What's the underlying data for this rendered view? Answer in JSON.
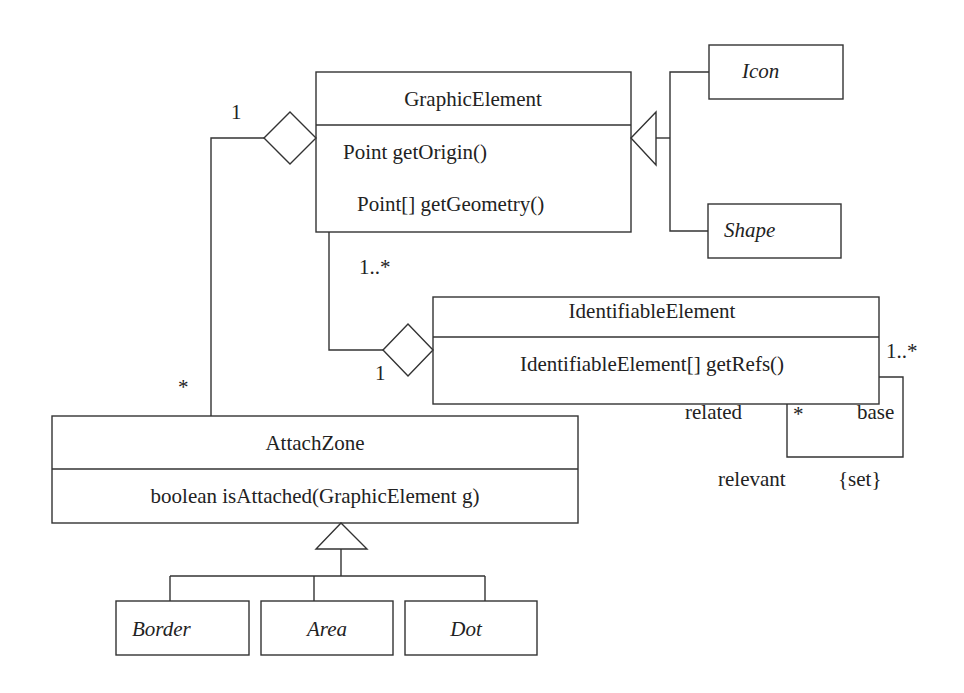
{
  "diagram": {
    "type": "UML class diagram",
    "classes": {
      "graphic_element": {
        "name": "GraphicElement",
        "methods": [
          "Point getOrigin()",
          "Point[] getGeometry()"
        ]
      },
      "icon": {
        "name": "Icon",
        "abstract_italic": true
      },
      "shape": {
        "name": "Shape",
        "abstract_italic": true
      },
      "identifiable_element": {
        "name": "IdentifiableElement",
        "methods": [
          "IdentifiableElement[] getRefs()"
        ]
      },
      "attach_zone": {
        "name": "AttachZone",
        "methods": [
          "boolean isAttached(GraphicElement g)"
        ]
      },
      "border": {
        "name": "Border",
        "abstract_italic": true
      },
      "area": {
        "name": "Area",
        "abstract_italic": true
      },
      "dot": {
        "name": "Dot",
        "abstract_italic": true
      }
    },
    "relationships": {
      "attach_aggregation": {
        "kind": "aggregation",
        "whole": "GraphicElement",
        "part": "AttachZone",
        "whole_multiplicity": "1",
        "part_multiplicity": "*"
      },
      "identifiable_aggregation": {
        "kind": "aggregation",
        "whole": "IdentifiableElement",
        "part": "GraphicElement",
        "whole_multiplicity": "1",
        "part_multiplicity": "1..*"
      },
      "graphic_generalization": {
        "kind": "generalization",
        "parent": "GraphicElement",
        "children": [
          "Icon",
          "Shape"
        ]
      },
      "attach_generalization": {
        "kind": "generalization",
        "parent": "AttachZone",
        "children": [
          "Border",
          "Area",
          "Dot"
        ]
      },
      "self_association": {
        "kind": "association",
        "class": "IdentifiableElement",
        "base_multiplicity": "1..*",
        "related_multiplicity": "*",
        "role_related": "related",
        "role_base": "base",
        "name": "relevant",
        "constraint": "{set}"
      }
    }
  }
}
